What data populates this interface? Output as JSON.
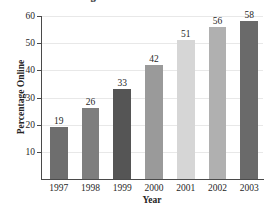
{
  "chart_data": {
    "type": "bar",
    "title": "Percentage of US Households Online",
    "xlabel": "Year",
    "ylabel": "Percentage Online",
    "categories": [
      "1997",
      "1998",
      "1999",
      "2000",
      "2001",
      "2002",
      "2003"
    ],
    "values": [
      19,
      26,
      33,
      42,
      51,
      56,
      58
    ],
    "value_labels": [
      "19",
      "26",
      "33",
      "42",
      "51",
      "56",
      "58"
    ],
    "bar_colors": [
      "#6e6e6e",
      "#7e7e7e",
      "#555555",
      "#9a9a9a",
      "#d6d6d6",
      "#b0b0b0",
      "#6a6a6a"
    ],
    "ylim": [
      0,
      60
    ],
    "yticks": [
      10,
      20,
      30,
      40,
      50,
      60
    ],
    "ytick_labels": [
      "10",
      "20",
      "30",
      "40",
      "50",
      "60"
    ],
    "grid": true,
    "grid_color": "#e8e8e8",
    "legend": null,
    "axis_color": "#4a4a4a"
  }
}
